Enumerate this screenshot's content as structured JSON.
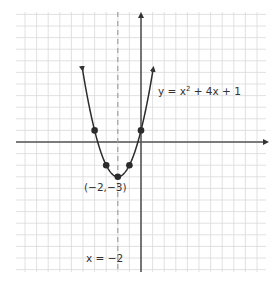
{
  "chart_data": {
    "type": "line",
    "title": "",
    "function_label": "y = x² + 4x + 1",
    "function_label_parts": {
      "pre": "y = x",
      "sup": "2",
      "post": " + 4x + 1"
    },
    "vertex_label": "(−2,−3)",
    "axis_of_symmetry_label": "x = −2",
    "xlabel": "",
    "ylabel": "",
    "xlim": [
      -10.8,
      10.8
    ],
    "ylim": [
      -11.3,
      11.0
    ],
    "grid": true,
    "series": [
      {
        "name": "y = x^2 + 4x + 1",
        "x": [
          -5,
          -4,
          -3,
          -2,
          -1,
          0,
          1
        ],
        "y": [
          6,
          1,
          -2,
          -3,
          -2,
          1,
          6
        ]
      }
    ],
    "marked_points": [
      {
        "x": -4,
        "y": 1
      },
      {
        "x": -3,
        "y": -2
      },
      {
        "x": -2,
        "y": -3
      },
      {
        "x": -1,
        "y": -2
      },
      {
        "x": 0,
        "y": 1
      }
    ],
    "axis_of_symmetry": -2
  },
  "colors": {
    "grid": "#d9d9d9",
    "axis": "#555555",
    "curve": "#2b2b2b",
    "dashed": "#9a9a9a",
    "text": "#333333"
  },
  "labels": {
    "function": {
      "pre": "y = x",
      "sup": "2",
      "post": " + 4x + 1"
    },
    "vertex": "(−2,−3)",
    "symmetry": "x = −2"
  }
}
